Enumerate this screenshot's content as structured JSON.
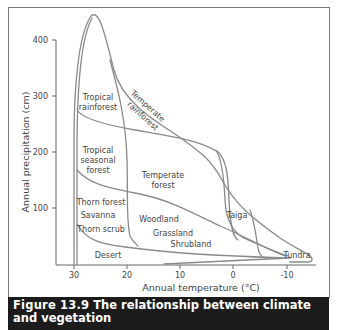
{
  "figure": {
    "number": "Figure 13.9",
    "caption": "The relationship between climate and vegetation"
  },
  "axes": {
    "x_label": "Annual temperature (°C)",
    "y_label": "Annual precipitation (cm)",
    "x_ticks": [
      "30",
      "20",
      "10",
      "0",
      "-10"
    ],
    "y_ticks": [
      "400",
      "300",
      "200",
      "100"
    ]
  },
  "biomes": {
    "tropical_rainforest": [
      "Tropical",
      "rainforest"
    ],
    "temperate_rainforest": [
      "Temperate",
      "rainforest"
    ],
    "tropical_seasonal_forest": [
      "Tropical",
      "seasonal",
      "forest"
    ],
    "temperate_forest": [
      "Temperate",
      "forest"
    ],
    "thorn_forest": "Thorn forest",
    "savanna": "Savanna",
    "thorn_scrub": "Thorn scrub",
    "woodland": "Woodland",
    "grassland": "Grassland",
    "shrubland": "Shrubland",
    "taiga": "Taiga",
    "desert": "Desert",
    "tundra": "Tundra"
  },
  "colors": {
    "curve": "#8a8a8a",
    "axis": "#666666",
    "caption_bg": "#1c1c1c",
    "caption_text": "#ffffff"
  }
}
